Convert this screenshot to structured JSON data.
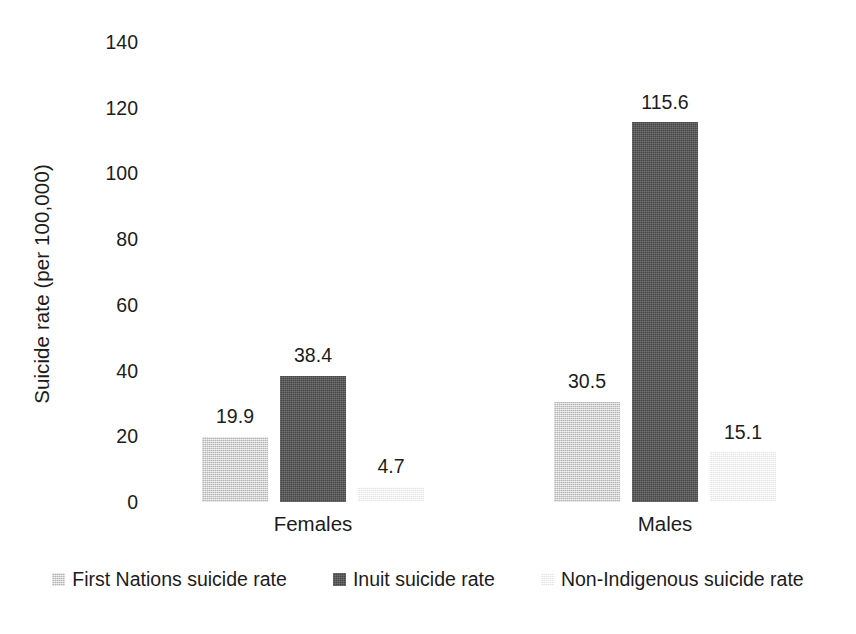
{
  "chart_data": {
    "type": "bar",
    "title": "",
    "xlabel": "",
    "ylabel": "Suicide rate (per 100,000)",
    "categories": [
      "Females",
      "Males"
    ],
    "series": [
      {
        "name": "First Nations suicide rate",
        "color": "#cacaca",
        "values": [
          19.9,
          30.5
        ],
        "labels": [
          "19.9",
          "30.5"
        ]
      },
      {
        "name": "Inuit suicide rate",
        "color": "#585858",
        "values": [
          38.4,
          115.6
        ],
        "labels": [
          "38.4",
          "115.6"
        ]
      },
      {
        "name": "Non-Indigenous suicide rate",
        "color": "#f3f3f3",
        "values": [
          4.7,
          15.1
        ],
        "labels": [
          "4.7",
          "15.1"
        ]
      }
    ],
    "ylim": [
      0,
      140
    ],
    "ytick_step": 20,
    "yticks": [
      "140",
      "120",
      "100",
      "80",
      "60",
      "40",
      "20",
      "0"
    ],
    "grid": false,
    "legend_position": "bottom"
  }
}
